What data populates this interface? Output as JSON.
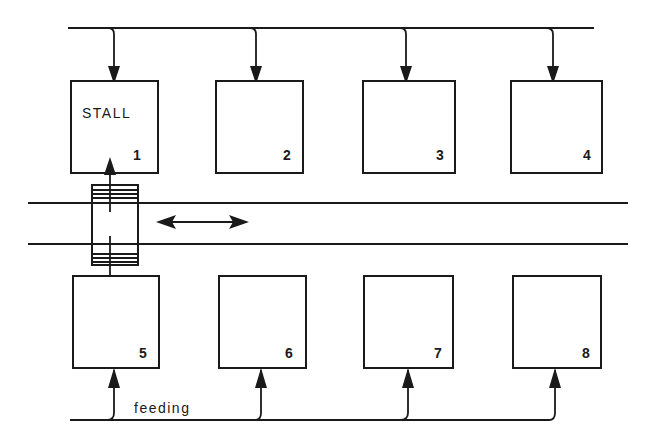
{
  "diagram": {
    "stall_label": "STALL",
    "stalls": [
      {
        "number": "1",
        "row": "top"
      },
      {
        "number": "2",
        "row": "top"
      },
      {
        "number": "3",
        "row": "top"
      },
      {
        "number": "4",
        "row": "top"
      },
      {
        "number": "5",
        "row": "bottom"
      },
      {
        "number": "6",
        "row": "bottom"
      },
      {
        "number": "7",
        "row": "bottom"
      },
      {
        "number": "8",
        "row": "bottom"
      }
    ],
    "feeding_label": "feeding",
    "colors": {
      "ink": "#1a1a1a",
      "background": "#ffffff"
    }
  }
}
